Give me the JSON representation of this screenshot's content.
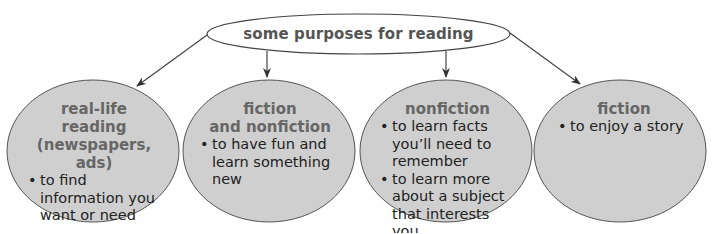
{
  "diagram": {
    "root": {
      "label": "some purposes for reading"
    },
    "nodes": [
      {
        "title_lines": [
          "real-life reading",
          "(newspapers, ads)"
        ],
        "bullets": [
          "to find information you want or need"
        ]
      },
      {
        "title_lines": [
          "fiction",
          "and nonfiction"
        ],
        "bullets": [
          "to have fun and learn something new"
        ]
      },
      {
        "title_lines": [
          "nonfiction"
        ],
        "bullets": [
          "to learn facts you’ll need to remember",
          "to learn more about a subject that interests you"
        ]
      },
      {
        "title_lines": [
          "fiction"
        ],
        "bullets": [
          "to enjoy a story"
        ]
      }
    ],
    "colors": {
      "node_fill": "#cfcfcf",
      "stroke": "#444444",
      "title_text": "#666666",
      "body_text": "#222222",
      "root_text": "#555555"
    }
  }
}
